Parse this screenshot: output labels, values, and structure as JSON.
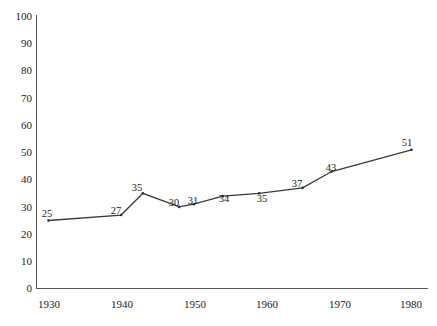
{
  "chart_data": {
    "type": "line",
    "title": "",
    "subtitle": "",
    "xlabel": "",
    "ylabel": "",
    "xlim": [
      1930,
      1980
    ],
    "ylim": [
      0,
      100
    ],
    "grid": false,
    "legend": null,
    "y_ticks": [
      "0",
      "10",
      "20",
      "30",
      "40",
      "50",
      "60",
      "70",
      "80",
      "90",
      "100"
    ],
    "x_ticks": [
      "1930",
      "1940",
      "1950",
      "1960",
      "1970",
      "1980"
    ],
    "series": [
      {
        "name": "series-1",
        "color": "#3a3a3a",
        "x": [
          1930,
          1940,
          1943,
          1948,
          1950,
          1954,
          1959,
          1965,
          1969,
          1980
        ],
        "values": [
          25,
          27,
          35,
          30,
          31,
          34,
          35,
          37,
          43,
          51
        ],
        "labels": [
          "25",
          "27",
          "35",
          "30",
          "31",
          "34",
          "35",
          "37",
          "43",
          "51"
        ]
      }
    ]
  },
  "axes": {
    "y_ticks": [
      {
        "label": "100",
        "value": 100
      },
      {
        "label": "90",
        "value": 90
      },
      {
        "label": "80",
        "value": 80
      },
      {
        "label": "70",
        "value": 70
      },
      {
        "label": "60",
        "value": 60
      },
      {
        "label": "50",
        "value": 50
      },
      {
        "label": "40",
        "value": 40
      },
      {
        "label": "30",
        "value": 30
      },
      {
        "label": "20",
        "value": 20
      },
      {
        "label": "10",
        "value": 10
      },
      {
        "label": "0",
        "value": 0
      }
    ],
    "x_ticks": [
      {
        "label": "1930",
        "value": 1930
      },
      {
        "label": "1940",
        "value": 1940
      },
      {
        "label": "1950",
        "value": 1950
      },
      {
        "label": "1960",
        "value": 1960
      },
      {
        "label": "1970",
        "value": 1970
      },
      {
        "label": "1980",
        "value": 1980
      }
    ]
  },
  "colors": {
    "background": "#ffffff",
    "axis": "#5a5a5a",
    "line": "#3a3a3a",
    "text": "#1c1c1c"
  }
}
